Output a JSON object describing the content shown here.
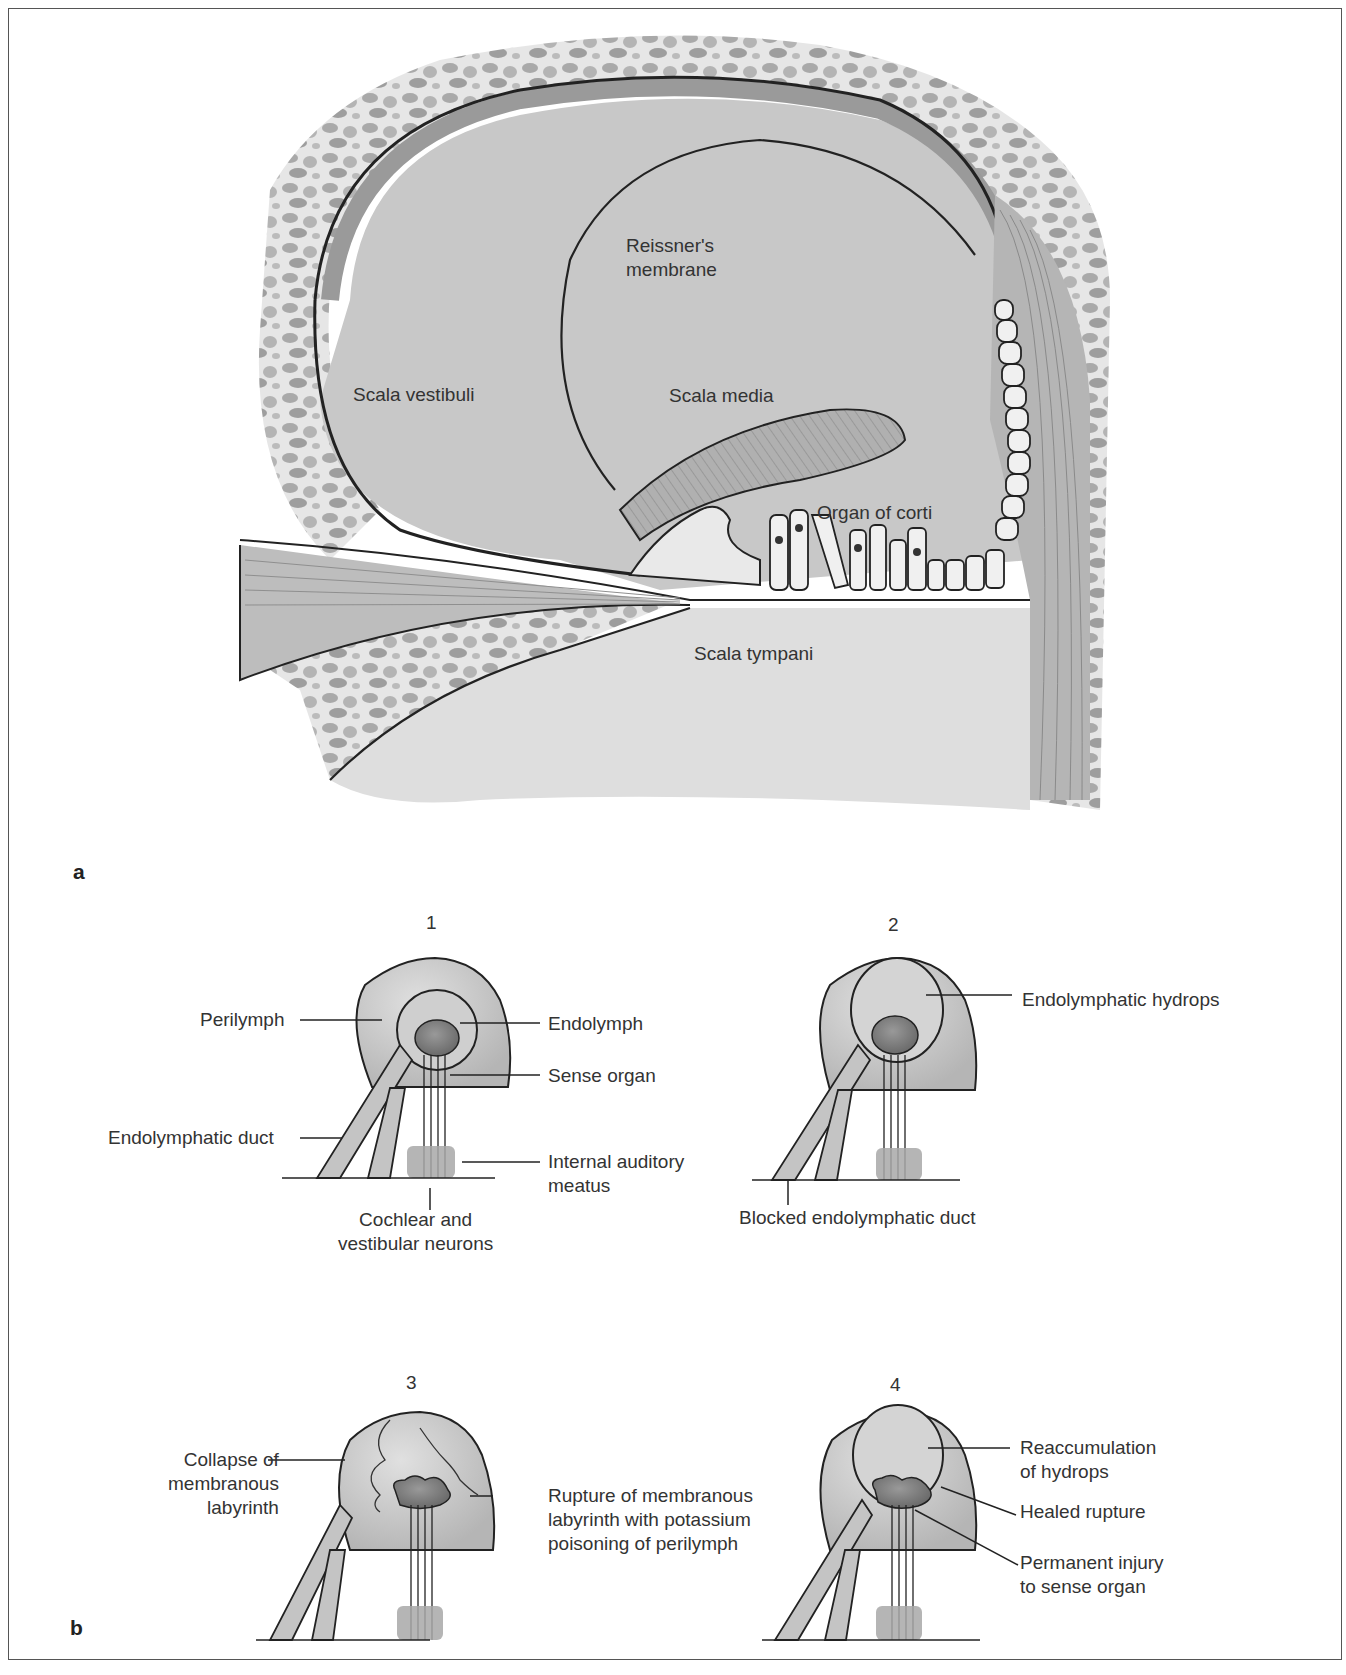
{
  "figure": {
    "panel_a": {
      "letter": "a",
      "labels": {
        "reissners_membrane": "Reissner's\nmembrane",
        "scala_vestibuli": "Scala vestibuli",
        "scala_media": "Scala media",
        "organ_of_corti": "Organ of corti",
        "scala_tympani": "Scala tympani"
      }
    },
    "panel_b": {
      "letter": "b",
      "stages": [
        {
          "number": "1",
          "labels": {
            "perilymph": "Perilymph",
            "endolymph": "Endolymph",
            "sense_organ": "Sense organ",
            "endolymphatic_duct": "Endolymphatic duct",
            "internal_auditory_meatus": "Internal auditory\nmeatus",
            "neurons": "Cochlear and\nvestibular neurons"
          }
        },
        {
          "number": "2",
          "labels": {
            "hydrops": "Endolymphatic hydrops",
            "blocked_duct": "Blocked endolymphatic  duct"
          }
        },
        {
          "number": "3",
          "labels": {
            "collapse": "Collapse of\nmembranous\nlabyrinth",
            "rupture": "Rupture of  membranous\nlabyrinth with potassium\npoisoning of perilymph"
          }
        },
        {
          "number": "4",
          "labels": {
            "reaccumulation": "Reaccumulation\nof hydrops",
            "healed_rupture": "Healed rupture",
            "permanent_injury": "Permanent injury\nto sense organ"
          }
        }
      ]
    },
    "colors": {
      "fluid_gray": "#c4c4c4",
      "light_gray": "#dcdcdc",
      "dark_organ": "#7a7a7a",
      "meatus_gray": "#a8a8a8",
      "line": "#222222"
    }
  }
}
